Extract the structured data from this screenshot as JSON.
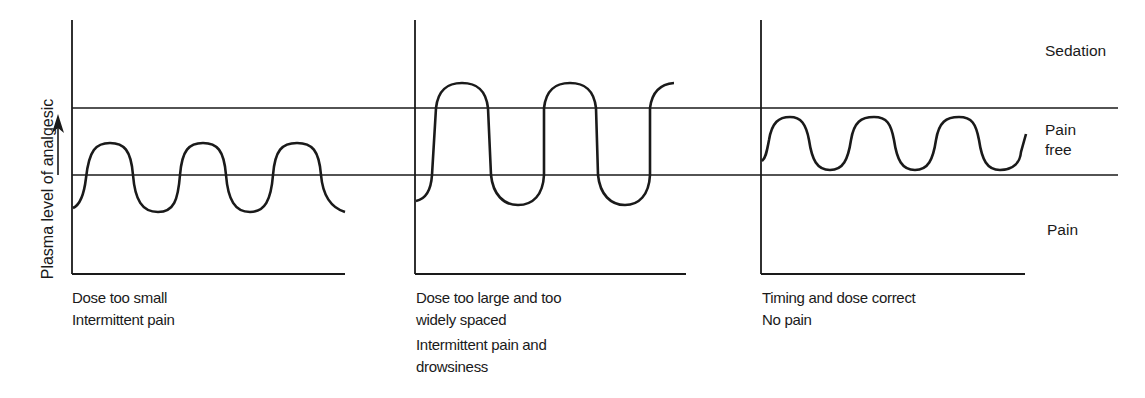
{
  "diagram": {
    "y_axis_label": "Plasma level of analgesic",
    "zones": {
      "top": "Sedation",
      "middle_line1": "Pain",
      "middle_line2": "free",
      "bottom": "Pain"
    },
    "panels": [
      {
        "id": "dose-too-small",
        "caption": [
          "Dose too small",
          "Intermittent pain"
        ]
      },
      {
        "id": "dose-too-large",
        "caption": [
          "Dose too large and too",
          "widely spaced",
          "Intermittent pain and",
          "drowsiness"
        ]
      },
      {
        "id": "timing-correct",
        "caption": [
          "Timing and dose correct",
          "No pain"
        ]
      }
    ],
    "colors": {
      "line": "#1a1a1a",
      "background": "#ffffff"
    }
  }
}
